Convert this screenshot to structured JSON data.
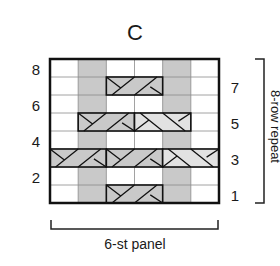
{
  "chart_title": "C",
  "grid": {
    "cols": 6,
    "rows": 8,
    "left_row_numbers": [
      "8",
      "6",
      "4",
      "2"
    ],
    "right_row_numbers": [
      "7",
      "5",
      "3",
      "1"
    ]
  },
  "colors": {
    "shade_dark": "#c9c9c9",
    "shade_light": "#e2e2e2",
    "grid_line": "#8a8a8a",
    "border": "#111111"
  },
  "shaded_purl_columns": [
    2,
    5
  ],
  "cables": [
    {
      "row": 7,
      "start_col": 3,
      "span": 2,
      "cross": "left",
      "shade": "dark"
    },
    {
      "row": 5,
      "start_col": 2,
      "span": 2,
      "cross": "left",
      "shade": "dark"
    },
    {
      "row": 5,
      "start_col": 4,
      "span": 2,
      "cross": "right",
      "shade": "light"
    },
    {
      "row": 3,
      "start_col": 1,
      "span": 2,
      "cross": "left",
      "shade": "dark"
    },
    {
      "row": 3,
      "start_col": 3,
      "span": 2,
      "cross": "left",
      "shade": "dark"
    },
    {
      "row": 3,
      "start_col": 5,
      "span": 2,
      "cross": "right",
      "shade": "light"
    },
    {
      "row": 1,
      "start_col": 3,
      "span": 2,
      "cross": "left",
      "shade": "dark"
    }
  ],
  "bottom_bracket_label": "6-st panel",
  "side_bracket_label": "8-row repeat"
}
